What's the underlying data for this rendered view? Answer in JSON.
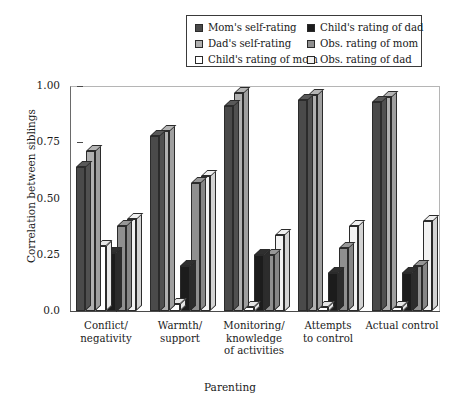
{
  "chart_data": {
    "type": "bar",
    "title": "",
    "xlabel": "Parenting",
    "ylabel": "Correlation between siblings",
    "ylim": [
      0.0,
      1.0
    ],
    "ytick_labels": [
      "0.0",
      "0.25",
      "0.50",
      "0.75",
      "1.00"
    ],
    "ytick_values": [
      0.0,
      0.25,
      0.5,
      0.75,
      1.0
    ],
    "grid": false,
    "legend_position": "top-center",
    "categories": [
      "Conflict/\nnegativity",
      "Warmth/\nsupport",
      "Monitoring/\nknowledge\nof activities",
      "Attempts\nto control",
      "Actual control"
    ],
    "category_lines": [
      [
        "Conflict/",
        "negativity"
      ],
      [
        "Warmth/",
        "support"
      ],
      [
        "Monitoring/",
        "knowledge",
        "of activities"
      ],
      [
        "Attempts",
        "to control"
      ],
      [
        "Actual control"
      ]
    ],
    "series": [
      {
        "name": "Mom's self-rating",
        "color": "#4a4a4a",
        "values": [
          0.64,
          0.78,
          0.91,
          0.94,
          0.93
        ]
      },
      {
        "name": "Dad's self-rating",
        "color": "#b0b0b0",
        "values": [
          0.71,
          0.8,
          0.97,
          0.96,
          0.95
        ]
      },
      {
        "name": "Child's rating of mom",
        "color": "#ffffff",
        "values": [
          0.29,
          0.03,
          0.02,
          0.02,
          0.02
        ]
      },
      {
        "name": "Child's rating of dad",
        "color": "#1c1c1c",
        "values": [
          0.26,
          0.2,
          0.25,
          0.17,
          0.17
        ]
      },
      {
        "name": "Obs. rating of mom",
        "color": "#8f8f8f",
        "values": [
          0.38,
          0.57,
          0.25,
          0.28,
          0.2
        ]
      },
      {
        "name": "Obs. rating of dad",
        "color": "#f2f2f2",
        "values": [
          0.41,
          0.6,
          0.34,
          0.38,
          0.4
        ]
      }
    ]
  },
  "legend": {
    "left_column": [
      {
        "label": "Mom's self-rating",
        "swatch": "#4a4a4a"
      },
      {
        "label": "Dad's self-rating",
        "swatch": "#b0b0b0"
      },
      {
        "label": "Child's rating of mom",
        "swatch": "#ffffff"
      }
    ],
    "right_column": [
      {
        "label": "Child's rating of dad",
        "swatch": "#1c1c1c"
      },
      {
        "label": "Obs. rating of mom",
        "swatch": "#8f8f8f"
      },
      {
        "label": "Obs. rating of dad",
        "swatch": "#f2f2f2"
      }
    ]
  }
}
